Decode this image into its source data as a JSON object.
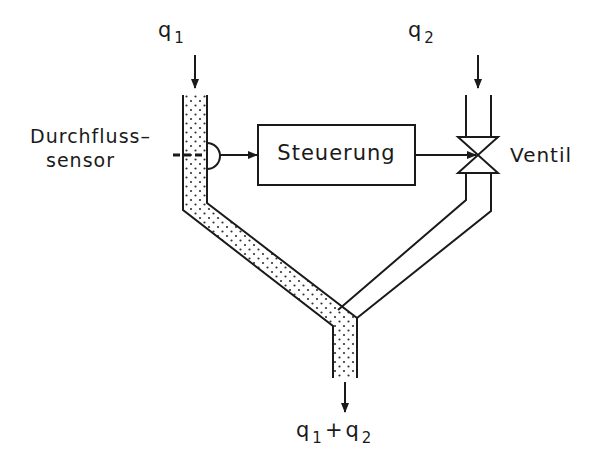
{
  "diagram": {
    "title_fragment": "b) Verschnitt-Regelung",
    "inputs": {
      "q1": {
        "symbol": "q",
        "subscript": "1"
      },
      "q2": {
        "symbol": "q",
        "subscript": "2"
      }
    },
    "output": {
      "q1": "q",
      "q1_sub": "1",
      "plus": "+",
      "q2": "q",
      "q2_sub": "2"
    },
    "labels": {
      "sensor_line1": "Durchfluss–",
      "sensor_line2": "sensor",
      "controller": "Steuerung",
      "valve": "Ventil"
    },
    "colors": {
      "line": "#1a1a1a",
      "background": "#ffffff",
      "fluid_dots": "#333333"
    }
  }
}
